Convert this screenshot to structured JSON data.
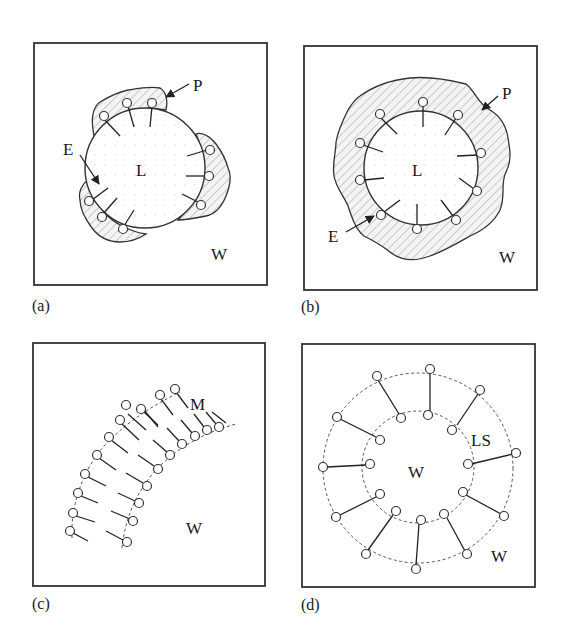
{
  "figure": {
    "panels": [
      {
        "id": "a",
        "caption": "(a)",
        "description": "Liposome with patches of attached polymer",
        "labels": {
          "P": "P",
          "E": "E",
          "L": "L",
          "W": "W"
        },
        "frame": {
          "x": 34,
          "y": 43,
          "w": 233,
          "h": 242
        },
        "circle": {
          "cx": 145,
          "cy": 168,
          "r": 60
        }
      },
      {
        "id": "b",
        "caption": "(b)",
        "description": "Liposome fully coated by polymer layer",
        "labels": {
          "P": "P",
          "E": "E",
          "L": "L",
          "W": "W"
        },
        "frame": {
          "x": 304,
          "y": 46,
          "w": 233,
          "h": 244
        },
        "circle": {
          "cx": 421,
          "cy": 168,
          "r": 57
        }
      },
      {
        "id": "c",
        "caption": "(c)",
        "description": "Bilayer membrane segment of amphiphiles",
        "labels": {
          "M": "M",
          "W": "W"
        },
        "frame": {
          "x": 33,
          "y": 343,
          "w": 232,
          "h": 243
        }
      },
      {
        "id": "d",
        "caption": "(d)",
        "description": "Spherical lipid shell (vesicle) cross-section",
        "labels": {
          "LS": "LS",
          "W_inner": "W",
          "W_outer": "W"
        },
        "frame": {
          "x": 302,
          "y": 344,
          "w": 233,
          "h": 243
        }
      }
    ]
  },
  "colors": {
    "line": "#333333",
    "hatch": "#9a9a9a",
    "background": "#ffffff"
  }
}
